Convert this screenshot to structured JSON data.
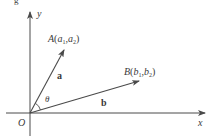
{
  "diagram": {
    "origin_label": "O",
    "x_axis_label": "x",
    "y_axis_label": "y",
    "point_a": {
      "name": "A",
      "open": "(",
      "c1": "a",
      "s1": "1",
      "comma": ",",
      "c2": "a",
      "s2": "2",
      "close": ")"
    },
    "point_b": {
      "name": "B",
      "open": "(",
      "c1": "b",
      "s1": "1",
      "comma": ",",
      "c2": "b",
      "s2": "2",
      "close": ")"
    },
    "vector_a_label": "a",
    "vector_b_label": "b",
    "angle_label": "θ",
    "top_fragment": "g",
    "colors": {
      "stroke": "#4a4a4a",
      "text": "#3a3a3a",
      "background": "#ffffff"
    }
  }
}
